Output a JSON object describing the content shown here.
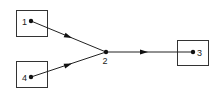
{
  "diagram": {
    "type": "flow-graph",
    "nodes": [
      {
        "id": "1",
        "label": "1",
        "boxed": true
      },
      {
        "id": "2",
        "label": "2",
        "boxed": false
      },
      {
        "id": "3",
        "label": "3",
        "boxed": true
      },
      {
        "id": "4",
        "label": "4",
        "boxed": true
      }
    ],
    "edges": [
      {
        "from": "1",
        "to": "2",
        "directed": true
      },
      {
        "from": "4",
        "to": "2",
        "directed": true
      },
      {
        "from": "2",
        "to": "3",
        "directed": true
      }
    ],
    "colors": {
      "stroke": "#222222",
      "background": "#ffffff"
    }
  }
}
